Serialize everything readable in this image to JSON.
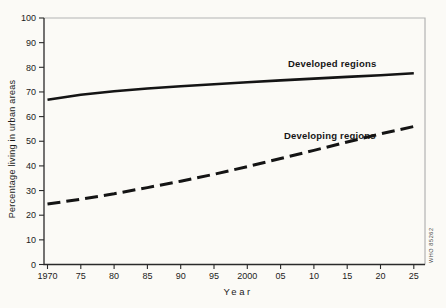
{
  "figure": {
    "background": "#fbfaf6",
    "frame_color": "#b3b3b3",
    "axis_color": "#2a2a2a",
    "text_color": "#1c1c1c",
    "line_color": "#141414",
    "watermark": "WHO 85262"
  },
  "chart_data": {
    "type": "line",
    "title": "",
    "xlabel": "Year",
    "ylabel": "Percentage living in urban areas",
    "x": [
      1970,
      1975,
      1980,
      1985,
      1990,
      1995,
      2000,
      2005,
      2010,
      2015,
      2020,
      2025
    ],
    "x_tick_labels": [
      "1970",
      "75",
      "80",
      "85",
      "90",
      "95",
      "2000",
      "05",
      "10",
      "15",
      "20",
      "25"
    ],
    "y_ticks": [
      0,
      10,
      20,
      30,
      40,
      50,
      60,
      70,
      80,
      90,
      100
    ],
    "xlim": [
      1970,
      2025
    ],
    "ylim": [
      0,
      100
    ],
    "grid": false,
    "legend_position": "inline-labels",
    "series": [
      {
        "name": "Developed regions",
        "style": "solid",
        "values": [
          66.8,
          68.9,
          70.3,
          71.4,
          72.3,
          73.1,
          73.9,
          74.7,
          75.4,
          76.1,
          76.8,
          77.6
        ]
      },
      {
        "name": "Developing regions",
        "style": "dashed",
        "values": [
          24.5,
          26.5,
          28.7,
          31.2,
          33.8,
          36.6,
          39.7,
          43.0,
          46.3,
          49.7,
          53.0,
          56.0
        ]
      }
    ]
  }
}
